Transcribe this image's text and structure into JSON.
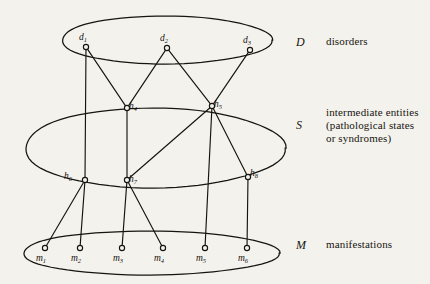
{
  "figure": {
    "title": "",
    "background": "#f4f2ed",
    "ink": "#16140f"
  },
  "legend": {
    "disorders": {
      "symbol": "D",
      "text": "disorders"
    },
    "intermediate": {
      "symbol": "S",
      "line1": "intermediate entities",
      "line2": "(pathological states",
      "line3": "or syndromes)"
    },
    "manifestations": {
      "symbol": "M",
      "text": "manifestations"
    }
  },
  "layers": [
    {
      "id": "D",
      "name": "disorders-layer",
      "cx": 166,
      "cy": 40,
      "rx": 105,
      "ry": 24
    },
    {
      "id": "S",
      "name": "intermediate-layer",
      "cx": 154,
      "cy": 148,
      "rx": 130,
      "ry": 40
    },
    {
      "id": "M",
      "name": "manifestations-layer",
      "cx": 150,
      "cy": 253,
      "rx": 128,
      "ry": 22
    }
  ],
  "nodes": [
    {
      "id": "d1",
      "label": "d",
      "sub": "1",
      "x": 86,
      "y": 47,
      "layer": "D",
      "label_dx": -3,
      "label_dy": -7
    },
    {
      "id": "d2",
      "label": "d",
      "sub": "2",
      "x": 167,
      "y": 48,
      "layer": "D",
      "label_dx": -3,
      "label_dy": -7
    },
    {
      "id": "d3",
      "label": "d",
      "sub": "3",
      "x": 250,
      "y": 50,
      "layer": "D",
      "label_dx": -3,
      "label_dy": -7
    },
    {
      "id": "h4",
      "label": "h",
      "sub": "4",
      "x": 127,
      "y": 108,
      "layer": "S",
      "label_dx": 6,
      "label_dy": 1
    },
    {
      "id": "h5",
      "label": "h",
      "sub": "5",
      "x": 212,
      "y": 106,
      "layer": "S",
      "label_dx": 6,
      "label_dy": 1
    },
    {
      "id": "h6",
      "label": "h",
      "sub": "6",
      "x": 85,
      "y": 180,
      "layer": "S",
      "label_dx": -17,
      "label_dy": -1
    },
    {
      "id": "h7",
      "label": "h",
      "sub": "7",
      "x": 127,
      "y": 180,
      "layer": "S",
      "label_dx": 6,
      "label_dy": 2
    },
    {
      "id": "h8",
      "label": "h",
      "sub": "8",
      "x": 248,
      "y": 177,
      "layer": "S",
      "label_dx": 6,
      "label_dy": -1
    },
    {
      "id": "m1",
      "label": "m",
      "sub": "1",
      "x": 45,
      "y": 248,
      "layer": "M",
      "label_dx": -4,
      "label_dy": 13
    },
    {
      "id": "m2",
      "label": "m",
      "sub": "2",
      "x": 80,
      "y": 248,
      "layer": "M",
      "label_dx": -4,
      "label_dy": 13
    },
    {
      "id": "m3",
      "label": "m",
      "sub": "3",
      "x": 122,
      "y": 248,
      "layer": "M",
      "label_dx": -4,
      "label_dy": 13
    },
    {
      "id": "m4",
      "label": "m",
      "sub": "4",
      "x": 163,
      "y": 248,
      "layer": "M",
      "label_dx": -4,
      "label_dy": 13
    },
    {
      "id": "m5",
      "label": "m",
      "sub": "5",
      "x": 205,
      "y": 248,
      "layer": "M",
      "label_dx": -4,
      "label_dy": 13
    },
    {
      "id": "m6",
      "label": "m",
      "sub": "6",
      "x": 247,
      "y": 248,
      "layer": "M",
      "label_dx": -4,
      "label_dy": 13
    }
  ],
  "edges": [
    {
      "from": "d1",
      "to": "h4"
    },
    {
      "from": "d1",
      "to": "h6"
    },
    {
      "from": "d2",
      "to": "h4"
    },
    {
      "from": "d2",
      "to": "h5"
    },
    {
      "from": "d3",
      "to": "h5"
    },
    {
      "from": "h4",
      "to": "h7"
    },
    {
      "from": "h5",
      "to": "h7"
    },
    {
      "from": "h5",
      "to": "h8"
    },
    {
      "from": "h5",
      "to": "m5"
    },
    {
      "from": "h6",
      "to": "m1"
    },
    {
      "from": "h6",
      "to": "m2"
    },
    {
      "from": "h7",
      "to": "m3"
    },
    {
      "from": "h7",
      "to": "m4"
    },
    {
      "from": "h8",
      "to": "m6"
    }
  ]
}
